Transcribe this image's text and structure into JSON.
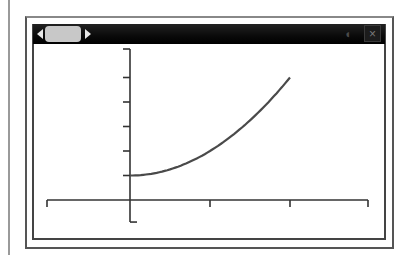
{
  "window": {
    "close_label": "×",
    "speaker_glyph": "◖",
    "slider": {
      "left_arrow": "◀",
      "right_arrow": "▶"
    }
  },
  "colors": {
    "titlebar": "#000000",
    "curve": "#4a4a4a",
    "axes": "#333333",
    "frame": "#555555"
  },
  "chart_data": {
    "type": "line",
    "title": "",
    "xlabel": "",
    "ylabel": "",
    "function": "y = x^2 + 1",
    "series": [
      {
        "name": "curve",
        "x": [
          0,
          0.25,
          0.5,
          0.75,
          1,
          1.25,
          1.5,
          1.75,
          2
        ],
        "values": [
          1,
          1.0625,
          1.25,
          1.5625,
          2,
          2.5625,
          3.25,
          4.0625,
          5
        ]
      }
    ],
    "xlim": [
      -1,
      3
    ],
    "ylim": [
      -0.9,
      6
    ],
    "x_ticks": [
      -1,
      0,
      1,
      2,
      3
    ],
    "y_ticks": [
      1,
      2,
      3,
      4,
      5,
      6
    ],
    "tick_labels_shown": false,
    "grid": false,
    "legend": "none"
  }
}
